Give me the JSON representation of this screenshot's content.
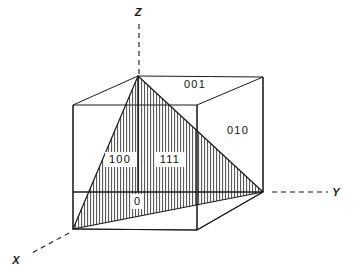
{
  "figure": {
    "background_color": "#ffffff",
    "line_color": "#1a1a1a",
    "hatch_color": "#333333"
  },
  "axes": [
    {
      "name": "z-axis",
      "label": "Z",
      "label_x": 138,
      "label_y": 16,
      "dash_from": [
        139,
        24
      ],
      "dash_to": [
        139,
        74
      ]
    },
    {
      "name": "y-axis",
      "label": "Y",
      "label_x": 336,
      "label_y": 196,
      "dash_from": [
        272,
        192
      ],
      "dash_to": [
        328,
        192
      ]
    },
    {
      "name": "x-axis",
      "label": "X",
      "label_x": 16,
      "label_y": 264,
      "dash_from": [
        69,
        233
      ],
      "dash_to": [
        30,
        254
      ]
    }
  ],
  "cube": {
    "vertices": {
      "top_front_left": [
        138,
        76
      ],
      "top_back_left": [
        73,
        105
      ],
      "top_front_right": [
        197,
        105
      ],
      "top_back_right": [
        263,
        77
      ],
      "bottom_front_left": [
        73,
        229
      ],
      "bottom_back_left": [
        73,
        192
      ],
      "bottom_front_right": [
        197,
        230
      ],
      "bottom_back_right": [
        263,
        192
      ]
    }
  },
  "plane_labels": [
    {
      "name": "plane-001",
      "text": "001",
      "x": 195,
      "y": 88,
      "plate_x": 180,
      "plate_y": 77,
      "plate_w": 32,
      "plate_h": 15
    },
    {
      "name": "plane-010",
      "text": "010",
      "x": 238,
      "y": 134,
      "plate_x": 223,
      "plate_y": 123,
      "plate_w": 32,
      "plate_h": 15
    },
    {
      "name": "plane-100",
      "text": "100",
      "x": 120,
      "y": 163,
      "plate_x": 105,
      "plate_y": 152,
      "plate_w": 32,
      "plate_h": 15
    },
    {
      "name": "plane-111",
      "text": "111",
      "x": 170,
      "y": 163,
      "plate_x": 155,
      "plate_y": 152,
      "plate_w": 30,
      "plate_h": 15
    }
  ],
  "origin": {
    "name": "origin",
    "text": "0",
    "x": 137,
    "y": 205,
    "plate_x": 131,
    "plate_y": 194,
    "plate_w": 12,
    "plate_h": 15
  },
  "hatched_plane": {
    "name": "plane-111-hatched",
    "indices": "111",
    "points": "138,76 263,192 73,229",
    "hatch_spacing_px": 3,
    "hatch_orientation": "vertical"
  }
}
